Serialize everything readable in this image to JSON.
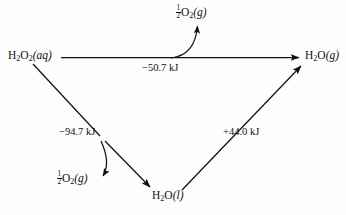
{
  "figure": {
    "type": "reaction-energy-cycle-diagram",
    "background_color": "#fdfdfd",
    "line_color": "#111111",
    "nodes": [
      {
        "id": "h2o2_aq",
        "label_parts": {
          "formula": "H",
          "sub1": "2",
          "mid": "O",
          "sub2": "2",
          "state": "(aq)"
        },
        "text": "H2O2(aq)",
        "x": 8,
        "y": 50
      },
      {
        "id": "o2_top",
        "text": "1/2 O2(g)",
        "x": 176,
        "y": 4
      },
      {
        "id": "h2o_g",
        "text": "H2O(g)",
        "x": 305,
        "y": 50
      },
      {
        "id": "o2_bottom",
        "text": "1/2 O2(g)",
        "x": 57,
        "y": 170
      },
      {
        "id": "h2o_l",
        "text": "H2O(l)",
        "x": 152,
        "y": 189
      }
    ],
    "edges": [
      {
        "id": "edge_top",
        "from": "h2o2_aq",
        "to": "h2o_g",
        "energy": "-50.7 kJ",
        "sign": "minus"
      },
      {
        "id": "edge_left_down",
        "from": "h2o2_aq",
        "to": "h2o_l",
        "energy": "-94.7 kJ",
        "sign": "minus"
      },
      {
        "id": "edge_right_up",
        "from": "h2o_l",
        "to": "h2o_g",
        "energy": "+44.0 kJ",
        "sign": "plus"
      }
    ]
  },
  "labels": {
    "h2o2_aq": {
      "formula": "H",
      "sub_a": "2",
      "o": "O",
      "sub_b": "2",
      "state": "(aq)"
    },
    "h2o_g": {
      "formula": "H",
      "sub_a": "2",
      "o": "O",
      "state": "(g)"
    },
    "h2o_l": {
      "formula": "H",
      "sub_a": "2",
      "o": "O",
      "state": "(l)"
    },
    "o2_top": {
      "frac_num": "1",
      "frac_den": "2",
      "o": "O",
      "sub": "2",
      "state": "(g)"
    },
    "o2_bottom": {
      "frac_num": "1",
      "frac_den": "2",
      "o": "O",
      "sub": "2",
      "state": "(g)"
    }
  },
  "energies": {
    "top": "−50.7 kJ",
    "left": "−94.7 kJ",
    "right": "+44.0 kJ"
  }
}
